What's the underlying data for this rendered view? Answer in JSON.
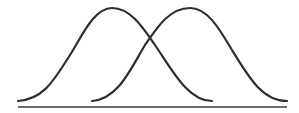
{
  "diagram": {
    "colors": {
      "curve": "#2e2e2e",
      "baseline": "#6e6e6e",
      "background": "#ffffff"
    },
    "curves": [
      {
        "name": "left-bell-curve",
        "start": [
          18,
          101
        ],
        "peak": [
          112,
          8
        ],
        "end": [
          212,
          101
        ]
      },
      {
        "name": "right-bell-curve",
        "start": [
          92,
          101
        ],
        "peak": [
          190,
          8
        ],
        "end": [
          287,
          101
        ]
      }
    ],
    "baseline": {
      "x1": 18,
      "x2": 287,
      "y": 107
    }
  }
}
